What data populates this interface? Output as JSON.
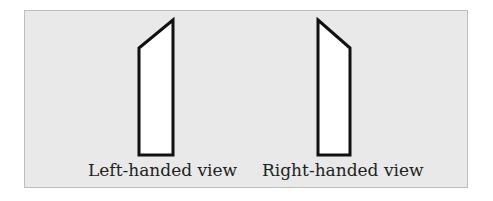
{
  "figure": {
    "background_color": "#e9e9e9",
    "stroke_color": "#111111",
    "views": [
      {
        "id": "left",
        "caption": "Left-handed view",
        "shape_points": "139,48 173,20 173,155 139,155"
      },
      {
        "id": "right",
        "caption": "Right-handed view",
        "shape_points": "318,20 350,48 350,155 318,155"
      }
    ]
  }
}
